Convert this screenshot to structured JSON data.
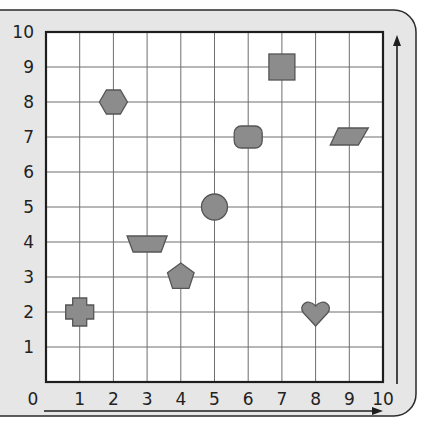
{
  "colors": {
    "frame_bg": "#e6e6e6",
    "frame_border": "#2a2a2a",
    "grid_bg": "#ffffff",
    "grid_line": "#6e6e6e",
    "grid_border": "#1e1e1e",
    "shape_fill": "#8c8c8c",
    "shape_stroke": "#555555",
    "text": "#222222"
  },
  "chart_data": {
    "type": "scatter",
    "title": "",
    "xlabel": "",
    "ylabel": "",
    "xlim": [
      0,
      10
    ],
    "ylim": [
      0,
      10
    ],
    "grid": true,
    "x_ticks": [
      "0",
      "1",
      "2",
      "3",
      "4",
      "5",
      "6",
      "7",
      "8",
      "9",
      "10"
    ],
    "y_ticks": [
      "1",
      "2",
      "3",
      "4",
      "5",
      "6",
      "7",
      "8",
      "9",
      "10"
    ],
    "points": [
      {
        "shape": "cross",
        "x": 1,
        "y": 2
      },
      {
        "shape": "hexagon",
        "x": 2,
        "y": 8
      },
      {
        "shape": "trapezoid",
        "x": 3,
        "y": 4
      },
      {
        "shape": "pentagon",
        "x": 4,
        "y": 3
      },
      {
        "shape": "circle",
        "x": 5,
        "y": 5
      },
      {
        "shape": "rounded-rectangle",
        "x": 6,
        "y": 7
      },
      {
        "shape": "square",
        "x": 7,
        "y": 9
      },
      {
        "shape": "heart",
        "x": 8,
        "y": 2
      },
      {
        "shape": "parallelogram",
        "x": 9,
        "y": 7
      }
    ],
    "legend": null
  }
}
